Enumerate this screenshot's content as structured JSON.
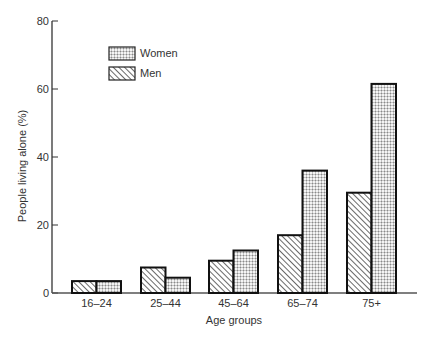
{
  "chart_data": {
    "type": "bar",
    "title": "",
    "xlabel": "Age groups",
    "ylabel": "People living alone (%)",
    "ylim": [
      0,
      80
    ],
    "yticks": [
      0,
      20,
      40,
      60,
      80
    ],
    "grid": false,
    "legend_position": "top-left (inside)",
    "categories": [
      "16–24",
      "25–44",
      "45–64",
      "65–74",
      "75+"
    ],
    "series": [
      {
        "name": "Men",
        "pattern": "diagonal-hatch",
        "values": [
          3.5,
          7.5,
          9.5,
          17,
          29.5
        ]
      },
      {
        "name": "Women",
        "pattern": "dotted-grid",
        "values": [
          3.5,
          4.5,
          12.5,
          36,
          61.5
        ]
      }
    ]
  },
  "legend": {
    "items": [
      {
        "label": "Women",
        "pattern": "dotted-grid"
      },
      {
        "label": "Men",
        "pattern": "diagonal-hatch"
      }
    ]
  },
  "colors": {
    "axis": "#333333",
    "bar_stroke": "#111111",
    "hatch": "#444444",
    "dots": "#8a8a8a",
    "background": "#ffffff"
  }
}
